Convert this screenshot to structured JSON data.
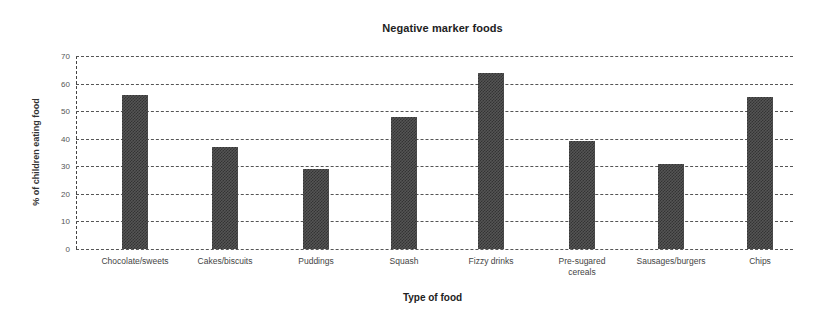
{
  "chart_data": {
    "type": "bar",
    "title": "Negative marker foods",
    "xlabel": "Type of food",
    "ylabel": "% of children eating food",
    "ylim": [
      0,
      70
    ],
    "yticks": [
      0,
      10,
      20,
      30,
      40,
      50,
      60,
      70
    ],
    "grid": true,
    "legend": null,
    "categories": [
      "Chocolate/sweets",
      "Cakes/biscuits",
      "Puddings",
      "Squash",
      "Fizzy drinks",
      "Pre-sugared cereals",
      "Sausages/burgers",
      "Chips"
    ],
    "values": [
      56,
      37,
      29,
      48,
      64,
      39,
      31,
      55
    ],
    "bar_color": "#555555"
  }
}
